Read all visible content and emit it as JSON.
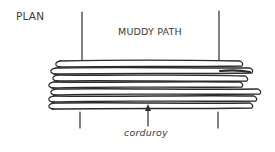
{
  "diagram": {
    "view_label": "PLAN",
    "path_label": "MUDDY PATH",
    "callout_label": "corduroy",
    "stroke_color": "#2b2b2b",
    "text_color": "#3a3a3a",
    "log_count": 7
  }
}
